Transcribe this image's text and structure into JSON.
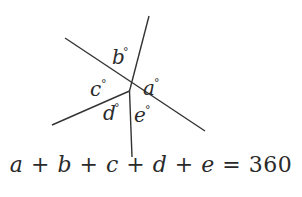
{
  "diagram": {
    "center": [
      129.5,
      91
    ],
    "line_color": "#333333",
    "lines": [
      {
        "name": "line-top",
        "x1": 129.5,
        "y1": 91,
        "x2": 149,
        "y2": 16
      },
      {
        "name": "line-diagonal",
        "x1": 65,
        "y1": 38,
        "x2": 205,
        "y2": 131
      },
      {
        "name": "line-lower-left",
        "x1": 52,
        "y1": 125,
        "x2": 129.5,
        "y2": 91
      },
      {
        "name": "line-bottom",
        "x1": 129.5,
        "y1": 91,
        "x2": 132,
        "y2": 157
      }
    ],
    "angles": [
      {
        "name": "a",
        "label": "a",
        "x": 143,
        "y": 95
      },
      {
        "name": "b",
        "label": "b",
        "x": 112,
        "y": 64
      },
      {
        "name": "c",
        "label": "c",
        "x": 90,
        "y": 96
      },
      {
        "name": "d",
        "label": "d",
        "x": 103,
        "y": 120
      },
      {
        "name": "e",
        "label": "e",
        "x": 134,
        "y": 122
      }
    ],
    "degree_symbol": "°"
  },
  "equation": {
    "terms": [
      "a",
      "b",
      "c",
      "d",
      "e"
    ],
    "operator": "+",
    "equals": "=",
    "total": "360"
  }
}
